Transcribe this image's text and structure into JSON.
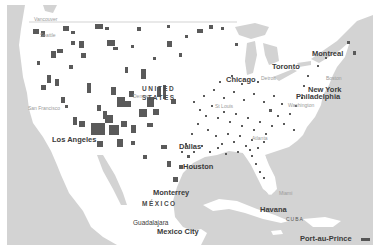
{
  "map": {
    "colors": {
      "water": "#d3d3d3",
      "land": "#ffffff",
      "data_fill": "#5a5a5a",
      "border_line": "#c8c8c8"
    },
    "countries": [
      {
        "id": "usa",
        "label_line1": "UNITED",
        "label_line2": "STATES"
      },
      {
        "id": "mexico",
        "label": "MÉXICO"
      },
      {
        "id": "cuba",
        "label": "CUBA"
      }
    ],
    "cities_major": [
      {
        "id": "montreal",
        "label": "Montreal"
      },
      {
        "id": "toronto",
        "label": "Toronto"
      },
      {
        "id": "chicago",
        "label": "Chicago"
      },
      {
        "id": "new-york",
        "label": "New York"
      },
      {
        "id": "philadelphia",
        "label": "Philadelphia"
      },
      {
        "id": "los-angeles",
        "label": "Los Angeles"
      },
      {
        "id": "dallas",
        "label": "Dallas"
      },
      {
        "id": "houston",
        "label": "Houston"
      },
      {
        "id": "monterrey",
        "label": "Monterrey"
      },
      {
        "id": "guadalajara",
        "label": "Guadalajara"
      },
      {
        "id": "mexico-city",
        "label": "Mexico City"
      },
      {
        "id": "havana",
        "label": "Havana"
      },
      {
        "id": "port-au-prince",
        "label": "Port-au-Prince"
      }
    ],
    "cities_minor": [
      {
        "id": "vancouver",
        "label": "Vancouver"
      },
      {
        "id": "seattle",
        "label": "Seattle"
      },
      {
        "id": "san-francisco",
        "label": "San Francisco"
      },
      {
        "id": "denver",
        "label": "Denver"
      },
      {
        "id": "detroit",
        "label": "Detroit"
      },
      {
        "id": "boston",
        "label": "Boston"
      },
      {
        "id": "washington",
        "label": "Washington"
      },
      {
        "id": "st-louis",
        "label": "St Louis"
      },
      {
        "id": "atlanta",
        "label": "Atlanta"
      },
      {
        "id": "miami",
        "label": "Miami"
      }
    ]
  }
}
